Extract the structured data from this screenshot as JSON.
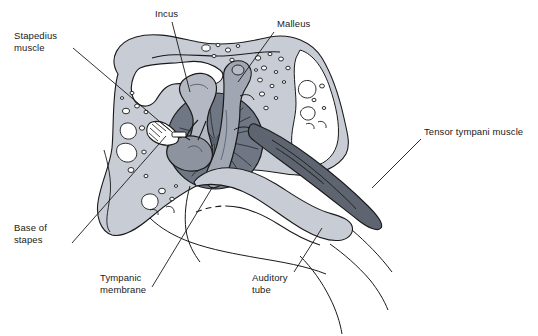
{
  "figure": {
    "caption_clipped": "The stapes is attached to the tympanic membrane by the incus and malleus, and lies in the oval window.",
    "background_color": "#ffffff",
    "line_color": "#1a1a1a",
    "width": 538,
    "height": 336
  },
  "palette": {
    "bone_light": "#c8ccd4",
    "bone_mid": "#b9bec7",
    "air_cell_white": "#ffffff",
    "incus_gray": "#b3b8c2",
    "malleus_gray": "#a0a6b2",
    "tympanic_membrane_dark": "#6f7684",
    "stapes_gray": "#8d939f",
    "tensor_muscle_dark": "#5e6470",
    "outline": "#1a1a1a"
  },
  "labels": [
    {
      "id": "stapedius-muscle",
      "text": "Stapedius\nmuscle",
      "x": 14,
      "y": 30,
      "leader": {
        "x1": 73,
        "y1": 48,
        "x2": 172,
        "y2": 132
      }
    },
    {
      "id": "incus",
      "text": "Incus",
      "x": 155,
      "y": 8,
      "leader": {
        "x1": 172,
        "y1": 22,
        "x2": 190,
        "y2": 92
      }
    },
    {
      "id": "malleus",
      "text": "Malleus",
      "x": 277,
      "y": 18,
      "leader": {
        "x1": 274,
        "y1": 32,
        "x2": 238,
        "y2": 82
      }
    },
    {
      "id": "tensor-tympani-muscle",
      "text": "Tensor tympani muscle",
      "x": 424,
      "y": 126,
      "leader": {
        "x1": 421,
        "y1": 139,
        "x2": 372,
        "y2": 188
      }
    },
    {
      "id": "base-of-stapes",
      "text": "Base of\nstapes",
      "x": 14,
      "y": 222,
      "leader": {
        "x1": 72,
        "y1": 243,
        "x2": 166,
        "y2": 136
      }
    },
    {
      "id": "tympanic-membrane",
      "text": "Tympanic\nmembrane",
      "x": 100,
      "y": 272,
      "leader": {
        "x1": 152,
        "y1": 287,
        "x2": 212,
        "y2": 188
      }
    },
    {
      "id": "auditory-tube",
      "text": "Auditory\ntube",
      "x": 252,
      "y": 272,
      "leader": {
        "x1": 294,
        "y1": 272,
        "x2": 322,
        "y2": 228
      }
    }
  ],
  "structures": [
    {
      "id": "temporal-bone",
      "name": "Temporal bone with mastoid air cells",
      "fill": "#c8ccd4"
    },
    {
      "id": "incus-bone",
      "name": "Incus",
      "fill": "#b3b8c2"
    },
    {
      "id": "malleus-bone",
      "name": "Malleus",
      "fill": "#a0a6b2"
    },
    {
      "id": "stapes-bone",
      "name": "Stapes",
      "fill": "#8d939f"
    },
    {
      "id": "tympanic-membrane-shape",
      "name": "Tympanic membrane",
      "fill": "#6f7684"
    },
    {
      "id": "tensor-tympani-shape",
      "name": "Tensor tympani muscle",
      "fill": "#5e6470"
    },
    {
      "id": "auditory-tube-shape",
      "name": "Auditory tube",
      "fill": "#c8ccd4"
    },
    {
      "id": "stapedius-shape",
      "name": "Stapedius muscle",
      "fill": "#ffffff"
    }
  ]
}
